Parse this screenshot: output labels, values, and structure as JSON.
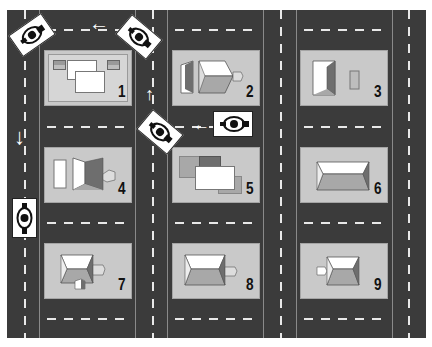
{
  "diagram": {
    "title": "",
    "colors": {
      "road": "#3b3b3b",
      "lane_marking": "#e8e8e8",
      "block": "#c9c9c9",
      "roof_light": "#ffffff",
      "roof_mid": "#a8a8a8",
      "roof_dark": "#6e6e6e"
    },
    "blocks": [
      {
        "number": "1",
        "building": "two overlapping flat roofs with two small sheds"
      },
      {
        "number": "2",
        "building": "hip-roof house with side shed and annex"
      },
      {
        "number": "3",
        "building": "hip-roof house with small outbuilding"
      },
      {
        "number": "4",
        "building": "hip-roof house with garage and annex"
      },
      {
        "number": "5",
        "building": "overlapping flat roofs"
      },
      {
        "number": "6",
        "building": "hip-roof house"
      },
      {
        "number": "7",
        "building": "hip-roof house with two annexes"
      },
      {
        "number": "8",
        "building": "hip-roof house with annex"
      },
      {
        "number": "9",
        "building": "hip-roof house with annex"
      }
    ],
    "motorcycles": [
      {
        "id": "moto-top-left",
        "orientation": "diagonal"
      },
      {
        "id": "moto-top-middle",
        "orientation": "diagonal"
      },
      {
        "id": "moto-middle-diagonal",
        "orientation": "diagonal"
      },
      {
        "id": "moto-middle-horizontal",
        "orientation": "facing-left"
      },
      {
        "id": "moto-left-vertical",
        "orientation": "facing-up"
      }
    ],
    "arrows": [
      {
        "id": "arrow-top",
        "direction": "left",
        "glyph": "←"
      },
      {
        "id": "arrow-left-down",
        "direction": "down",
        "glyph": "↓"
      },
      {
        "id": "arrow-middle-up",
        "direction": "up",
        "glyph": "↑"
      },
      {
        "id": "arrow-middle-left",
        "direction": "left",
        "glyph": "←"
      }
    ]
  }
}
